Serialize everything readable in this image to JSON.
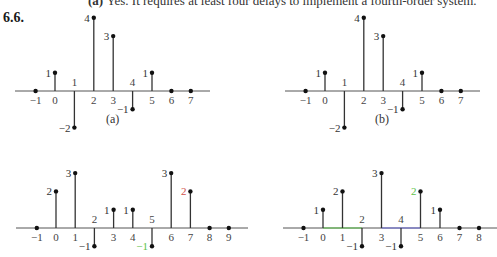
{
  "header": {
    "part_label": "(a)",
    "line": "Yes. It requires at least four delays to implement a fourth-order system."
  },
  "problem_number": "6.6.",
  "captions": {
    "a": "(a)",
    "b": "(b)"
  },
  "colors": {
    "axis": "#555555",
    "stem": "#333333",
    "green": "#5cc24a",
    "blue": "#6a6ad8",
    "red": "#d0504a"
  },
  "chart_data": [
    {
      "type": "stem",
      "title": "(a)",
      "n": [
        -1,
        0,
        1,
        2,
        3,
        4,
        5,
        6,
        7
      ],
      "values": [
        0,
        1,
        -2,
        4,
        3,
        -1,
        1,
        0,
        0
      ],
      "xlim": [
        -1,
        7
      ]
    },
    {
      "type": "stem",
      "title": "(b)",
      "n": [
        -1,
        0,
        1,
        2,
        3,
        4,
        5,
        6,
        7
      ],
      "values": [
        0,
        1,
        -2,
        4,
        3,
        -1,
        1,
        0,
        0
      ],
      "xlim": [
        -1,
        7
      ]
    },
    {
      "type": "stem",
      "title": "",
      "n": [
        -1,
        0,
        1,
        2,
        3,
        4,
        5,
        6,
        7,
        8,
        9
      ],
      "values": [
        0,
        2,
        3,
        -1,
        1,
        1,
        -1,
        3,
        2,
        0,
        0
      ],
      "xlim": [
        -1,
        9
      ],
      "annotations": [
        {
          "n": 7,
          "label": "2",
          "color": "red"
        },
        {
          "n": 5,
          "label": "-1",
          "color": "green"
        }
      ]
    },
    {
      "type": "stem",
      "title": "",
      "n": [
        -1,
        0,
        1,
        2,
        3,
        4,
        5,
        6,
        7,
        8
      ],
      "values": [
        0,
        1,
        2,
        -1,
        3,
        -1,
        2,
        1,
        0,
        0
      ],
      "xlim": [
        -1,
        8
      ],
      "axis_highlights": [
        {
          "from": 0,
          "to": 2,
          "color": "green"
        },
        {
          "from": 3,
          "to": 5,
          "color": "blue"
        }
      ],
      "annotations": [
        {
          "n": 5,
          "label": "2",
          "color": "green"
        }
      ]
    }
  ]
}
